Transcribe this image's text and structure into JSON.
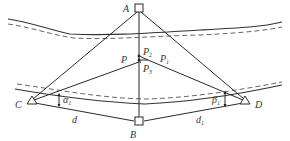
{
  "diagram": {
    "type": "survey-triangulation-across-river",
    "colors": {
      "line": "#2a2a2a",
      "text": "#333333",
      "background": "#ffffff"
    },
    "points": {
      "A": {
        "label": "A",
        "shape": "square-station"
      },
      "B": {
        "label": "B",
        "shape": "square-station"
      },
      "C": {
        "label": "C",
        "shape": "triangle-station"
      },
      "D": {
        "label": "D",
        "shape": "triangle-station"
      },
      "P": {
        "label": "P"
      },
      "P1": {
        "label": "P",
        "sub": "1"
      },
      "P2": {
        "label": "P",
        "sub": "2"
      },
      "P3": {
        "label": "P",
        "sub": "3"
      }
    },
    "angles": {
      "alpha1": {
        "label": "α",
        "sub": "1"
      },
      "beta1": {
        "label": "β",
        "sub": "1"
      }
    },
    "distances": {
      "d": {
        "label": "d"
      },
      "d1": {
        "label": "d",
        "sub": "1"
      }
    },
    "river": {
      "banks": 2,
      "style": "solid bank with dashed inner line"
    }
  }
}
